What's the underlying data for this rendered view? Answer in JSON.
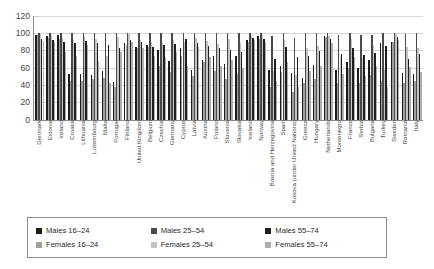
{
  "chart_data": {
    "type": "bar",
    "title": "",
    "subtitle": "",
    "xlabel": "",
    "ylabel": "",
    "ylim": [
      0,
      120
    ],
    "yticks": [
      0,
      20,
      40,
      60,
      80,
      100,
      120
    ],
    "grid": true,
    "legend_position": "bottom",
    "orientation": "vertical",
    "grouped": true,
    "categories": [
      "Denmark",
      "Estonia",
      "Ireland",
      "Croatia",
      "Lithuania",
      "Luxembourg",
      "Malta",
      "Portugal",
      "Finland",
      "United Kingdom",
      "Belgium",
      "Czechia",
      "Germany",
      "Cyprus",
      "Latvia",
      "Austria",
      "Poland",
      "Slovenia",
      "Slovakia",
      "Iceland",
      "Norway",
      "Bosnia and Herzegovina",
      "Spain",
      "Kosova (under United Nations)",
      "Greece",
      "Hungary",
      "Netherlands",
      "Montenegro",
      "France",
      "Serbia",
      "Bulgaria",
      "Turkey",
      "Sweden",
      "Romania",
      "Italy"
    ],
    "series": [
      {
        "name": "Males 16–24",
        "color": "#1c1c1c",
        "values": [
          98,
          96,
          97,
          53,
          52,
          51,
          56,
          43,
          88,
          84,
          86,
          80,
          67,
          82,
          57,
          69,
          73,
          64,
          73,
          92,
          96,
          57,
          62,
          54,
          48,
          63,
          96,
          57,
          66,
          60,
          69,
          88,
          90,
          54,
          53
        ]
      },
      {
        "name": "Males 25–54",
        "color": "#4a4a4a",
        "values": [
          100,
          100,
          100,
          100,
          100,
          100,
          100,
          100,
          100,
          100,
          100,
          100,
          100,
          100,
          100,
          100,
          100,
          100,
          100,
          100,
          100,
          96,
          100,
          94,
          100,
          100,
          100,
          98,
          100,
          97,
          98,
          100,
          100,
          99,
          100
        ]
      },
      {
        "name": "Males 55–74",
        "color": "#1f1f1f",
        "values": [
          93,
          92,
          90,
          88,
          91,
          88,
          86,
          83,
          92,
          90,
          84,
          86,
          87,
          93,
          88,
          85,
          82,
          80,
          78,
          94,
          93,
          70,
          84,
          72,
          73,
          79,
          93,
          76,
          83,
          74,
          77,
          85,
          95,
          70,
          76
        ]
      },
      {
        "name": "Females 16–24",
        "color": "#9f9f9f",
        "values": [
          97,
          94,
          93,
          44,
          45,
          47,
          48,
          37,
          86,
          83,
          84,
          62,
          55,
          73,
          50,
          66,
          56,
          47,
          52,
          90,
          93,
          37,
          55,
          32,
          42,
          47,
          95,
          42,
          60,
          42,
          51,
          44,
          89,
          42,
          44
        ]
      },
      {
        "name": "Females 25–54",
        "color": "#c4c4c4",
        "values": [
          99,
          98,
          94,
          92,
          96,
          93,
          73,
          95,
          99,
          92,
          90,
          88,
          92,
          90,
          94,
          91,
          87,
          93,
          88,
          98,
          98,
          56,
          92,
          51,
          82,
          85,
          96,
          72,
          93,
          71,
          85,
          57,
          99,
          84,
          82
        ]
      },
      {
        "name": "Females 55–74",
        "color": "#b0b0b0",
        "values": [
          91,
          90,
          78,
          73,
          86,
          67,
          42,
          78,
          90,
          83,
          73,
          72,
          78,
          62,
          84,
          72,
          62,
          69,
          60,
          92,
          90,
          44,
          66,
          37,
          56,
          62,
          88,
          52,
          72,
          50,
          62,
          38,
          92,
          61,
          55
        ]
      }
    ]
  },
  "legend": {
    "items": [
      {
        "label": "Males 16–24",
        "color": "#1c1c1c"
      },
      {
        "label": "Males 25–54",
        "color": "#4a4a4a"
      },
      {
        "label": "Males 55–74",
        "color": "#1f1f1f"
      },
      {
        "label": "Females 16–24",
        "color": "#9f9f9f"
      },
      {
        "label": "Females 25–54",
        "color": "#c4c4c4"
      },
      {
        "label": "Females 55–74",
        "color": "#b0b0b0"
      }
    ]
  }
}
